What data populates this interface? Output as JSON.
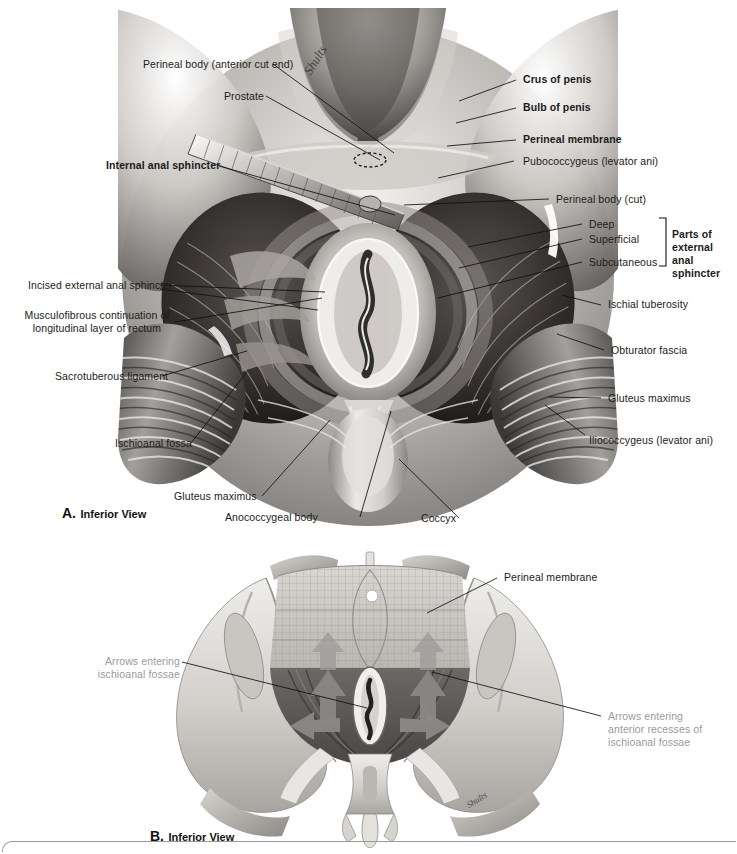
{
  "figure": {
    "panel_a": {
      "caption_letter": "A.",
      "caption_text": "Inferior View",
      "labels": [
        {
          "id": "perineal-body-anterior-cut-end",
          "plain": "Perineal body (",
          "italic": "anterior cut end",
          "tail": ")",
          "bold": false
        },
        {
          "id": "prostate",
          "plain": "Prostate",
          "bold": false
        },
        {
          "id": "internal-anal-sphincter",
          "plain": "Internal anal sphincter",
          "bold": true
        },
        {
          "id": "incised-external-anal-sphincter",
          "plain": "Incised external anal sphincter",
          "bold": false
        },
        {
          "id": "musculofibrous-continuation",
          "line1": "Musculofibrous continuation of",
          "line2": "longitudinal layer of rectum",
          "bold": false
        },
        {
          "id": "sacrotuberous-ligament",
          "plain": "Sacrotuberous ligament",
          "bold": false
        },
        {
          "id": "ischioanal-fossa",
          "plain": "Ischioanal fossa",
          "bold": false
        },
        {
          "id": "gluteus-maximus-left",
          "plain": "Gluteus maximus",
          "bold": false
        },
        {
          "id": "anococcygeal-body",
          "plain": "Anococcygeal body",
          "bold": false
        },
        {
          "id": "coccyx",
          "plain": "Coccyx",
          "bold": false
        },
        {
          "id": "crus-of-penis",
          "plain": "Crus of penis",
          "bold": true
        },
        {
          "id": "bulb-of-penis",
          "plain": "Bulb of penis",
          "bold": true
        },
        {
          "id": "perineal-membrane",
          "plain": "Perineal membrane",
          "bold": true
        },
        {
          "id": "pubococcygeus",
          "plain": "Pubococcygeus (levator ani)",
          "bold": false
        },
        {
          "id": "perineal-body-cut",
          "plain": "Perineal body (",
          "italic": "cut",
          "tail": ")",
          "bold": false
        },
        {
          "id": "deep",
          "plain": "Deep",
          "bold": false
        },
        {
          "id": "superficial",
          "plain": "Superficial",
          "bold": false
        },
        {
          "id": "subcutaneous",
          "plain": "Subcutaneous",
          "bold": false
        },
        {
          "id": "parts-of-external-anal-sphincter",
          "line1": "Parts of external",
          "line2": "anal sphincter",
          "bold": true
        },
        {
          "id": "ischial-tuberosity",
          "plain": "Ischial tuberosity",
          "bold": false
        },
        {
          "id": "obturator-fascia",
          "plain": "Obturator fascia",
          "bold": false
        },
        {
          "id": "gluteus-maximus-right",
          "plain": "Gluteus maximus",
          "bold": false
        },
        {
          "id": "iliococcygeus",
          "plain": "Iliococcygeus (levator ani)",
          "bold": false
        }
      ],
      "text": {
        "perineal_body_anterior_a": "Perineal body (",
        "perineal_body_anterior_i": "anterior cut end",
        "perineal_body_anterior_z": ")",
        "prostate": "Prostate",
        "internal_anal_sphincter": "Internal anal sphincter",
        "incised_external_anal_sphincter": "Incised external anal sphincter",
        "musculofibrous_l1": "Musculofibrous continuation of",
        "musculofibrous_l2": "longitudinal layer of rectum",
        "sacrotuberous_ligament": "Sacrotuberous ligament",
        "ischioanal_fossa": "Ischioanal fossa",
        "gluteus_maximus_left": "Gluteus maximus",
        "anococcygeal_body": "Anococcygeal body",
        "coccyx": "Coccyx",
        "crus_of_penis": "Crus of penis",
        "bulb_of_penis": "Bulb of penis",
        "perineal_membrane": "Perineal membrane",
        "pubococcygeus": "Pubococcygeus (levator ani)",
        "perineal_body_cut_a": "Perineal body (",
        "perineal_body_cut_i": "cut",
        "perineal_body_cut_z": ")",
        "deep": "Deep",
        "superficial": "Superficial",
        "subcutaneous": "Subcutaneous",
        "parts_l1": "Parts of external",
        "parts_l2": "anal sphincter",
        "ischial_tuberosity": "Ischial tuberosity",
        "obturator_fascia": "Obturator fascia",
        "gluteus_maximus_right": "Gluteus maximus",
        "iliococcygeus": "Iliococcygeus (levator ani)"
      },
      "artist_signature": "Shults"
    },
    "panel_b": {
      "caption_letter": "B.",
      "caption_text": "Inferior View",
      "text": {
        "perineal_membrane": "Perineal membrane",
        "arrows_left_i": "Arrows",
        "arrows_left_a": " entering",
        "arrows_left_l2": "ischioanal fossae",
        "arrows_right_i": "Arrows",
        "arrows_right_a": " entering",
        "arrows_right_l2": "anterior recesses of",
        "arrows_right_l3": "ischioanal fossae"
      },
      "artist_signature": "Shults"
    },
    "colors": {
      "label_text": "#1b1b1b",
      "gray_label_text": "#9a9a9a",
      "leader_line": "#111111",
      "page_rule": "#9a9a9a",
      "background": "#ffffff",
      "arrow_fill": "#8e8e8e",
      "bone_light": "#d8d5d0",
      "muscle_dark": "#6f6f6f"
    }
  }
}
